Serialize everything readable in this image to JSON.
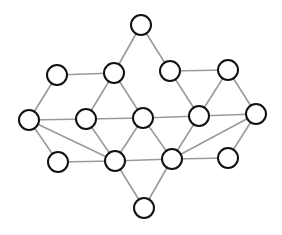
{
  "diagram": {
    "type": "undirected-graph",
    "canvas": {
      "width": 282,
      "height": 235,
      "background": "#ffffff"
    },
    "style": {
      "node_radius": 10,
      "node_fill": "#ffffff",
      "node_stroke": "#111111",
      "edge_color": "#9a9a9a"
    },
    "nodes": [
      {
        "id": "n0",
        "x": 141,
        "y": 25
      },
      {
        "id": "n1",
        "x": 57,
        "y": 75
      },
      {
        "id": "n2",
        "x": 114,
        "y": 73
      },
      {
        "id": "n3",
        "x": 170,
        "y": 71
      },
      {
        "id": "n4",
        "x": 228,
        "y": 70
      },
      {
        "id": "n5",
        "x": 29,
        "y": 120
      },
      {
        "id": "n6",
        "x": 86,
        "y": 119
      },
      {
        "id": "n7",
        "x": 143,
        "y": 118
      },
      {
        "id": "n8",
        "x": 199,
        "y": 116
      },
      {
        "id": "n9",
        "x": 256,
        "y": 114
      },
      {
        "id": "n10",
        "x": 58,
        "y": 162
      },
      {
        "id": "n11",
        "x": 115,
        "y": 161
      },
      {
        "id": "n12",
        "x": 172,
        "y": 159
      },
      {
        "id": "n13",
        "x": 228,
        "y": 158
      },
      {
        "id": "n14",
        "x": 144,
        "y": 208
      }
    ],
    "edges": [
      [
        "n0",
        "n2"
      ],
      [
        "n0",
        "n3"
      ],
      [
        "n1",
        "n2"
      ],
      [
        "n1",
        "n5"
      ],
      [
        "n2",
        "n6"
      ],
      [
        "n2",
        "n7"
      ],
      [
        "n3",
        "n4"
      ],
      [
        "n3",
        "n8"
      ],
      [
        "n4",
        "n8"
      ],
      [
        "n4",
        "n9"
      ],
      [
        "n5",
        "n6"
      ],
      [
        "n6",
        "n7"
      ],
      [
        "n7",
        "n8"
      ],
      [
        "n8",
        "n9"
      ],
      [
        "n5",
        "n10"
      ],
      [
        "n5",
        "n11"
      ],
      [
        "n6",
        "n11"
      ],
      [
        "n7",
        "n11"
      ],
      [
        "n7",
        "n12"
      ],
      [
        "n8",
        "n12"
      ],
      [
        "n9",
        "n12"
      ],
      [
        "n9",
        "n13"
      ],
      [
        "n10",
        "n11"
      ],
      [
        "n11",
        "n12"
      ],
      [
        "n12",
        "n13"
      ],
      [
        "n11",
        "n14"
      ],
      [
        "n12",
        "n14"
      ]
    ]
  }
}
